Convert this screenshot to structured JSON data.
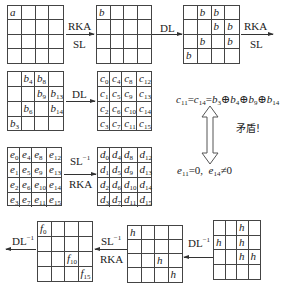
{
  "grids": {
    "a": {
      "cells": [
        "a",
        "",
        "",
        "",
        "",
        "",
        "",
        "",
        "",
        "",
        "",
        "",
        "",
        "",
        "",
        ""
      ]
    },
    "b_plain": {
      "cells": [
        "b",
        "",
        "",
        "",
        "",
        "",
        "",
        "",
        "",
        "",
        "",
        "",
        "",
        "",
        "",
        ""
      ]
    },
    "b_dl": {
      "cells": [
        "",
        "b",
        "b",
        "",
        "",
        "",
        "b",
        "b",
        "",
        "b",
        "",
        "b",
        "b",
        "",
        "",
        ""
      ]
    },
    "b_indexed": {
      "cells": [
        {
          "v": "",
          "s": ""
        },
        {
          "v": "b",
          "s": "4"
        },
        {
          "v": "b",
          "s": "8"
        },
        {
          "v": "",
          "s": ""
        },
        {
          "v": "",
          "s": ""
        },
        {
          "v": "",
          "s": ""
        },
        {
          "v": "b",
          "s": "9"
        },
        {
          "v": "b",
          "s": "13"
        },
        {
          "v": "",
          "s": ""
        },
        {
          "v": "b",
          "s": "6"
        },
        {
          "v": "",
          "s": ""
        },
        {
          "v": "b",
          "s": "14"
        },
        {
          "v": "b",
          "s": "3"
        },
        {
          "v": "",
          "s": ""
        },
        {
          "v": "",
          "s": ""
        },
        {
          "v": "",
          "s": ""
        }
      ]
    },
    "c": {
      "letter": "c",
      "indices": [
        "0",
        "4",
        "8",
        "12",
        "1",
        "5",
        "9",
        "13",
        "2",
        "6",
        "10",
        "14",
        "3",
        "7",
        "11",
        "15"
      ]
    },
    "e": {
      "letter": "e",
      "indices": [
        "0",
        "4",
        "8",
        "12",
        "1",
        "5",
        "9",
        "13",
        "2",
        "6",
        "10",
        "14",
        "3",
        "7",
        "11",
        "15"
      ]
    },
    "d": {
      "letter": "d",
      "indices": [
        "0",
        "4",
        "8",
        "12",
        "1",
        "5",
        "9",
        "13",
        "2",
        "6",
        "10",
        "14",
        "3",
        "7",
        "11",
        "15"
      ]
    },
    "f": {
      "cells": [
        {
          "v": "f",
          "s": "0"
        },
        {
          "v": "",
          "s": ""
        },
        {
          "v": "",
          "s": ""
        },
        {
          "v": "",
          "s": ""
        },
        {
          "v": "",
          "s": ""
        },
        {
          "v": "",
          "s": ""
        },
        {
          "v": "",
          "s": ""
        },
        {
          "v": "",
          "s": ""
        },
        {
          "v": "",
          "s": ""
        },
        {
          "v": "",
          "s": ""
        },
        {
          "v": "f",
          "s": "10"
        },
        {
          "v": "",
          "s": ""
        },
        {
          "v": "",
          "s": ""
        },
        {
          "v": "",
          "s": ""
        },
        {
          "v": "",
          "s": ""
        },
        {
          "v": "f",
          "s": "15"
        }
      ]
    },
    "h_sl": {
      "cells": [
        "h",
        "",
        "",
        "",
        "",
        "",
        "",
        "",
        "",
        "",
        "h",
        "",
        "",
        "",
        "",
        "h"
      ]
    },
    "h_dl": {
      "cells": [
        "",
        "",
        "h",
        "",
        "h",
        "",
        "h",
        "",
        "",
        "",
        "h",
        "h",
        "",
        "",
        "",
        ""
      ]
    }
  },
  "labels": {
    "rka": "RKA",
    "sl": "SL",
    "dl": "DL",
    "sl_inv": "SL",
    "dl_inv": "DL",
    "inv_sup": "−1",
    "contradiction": "矛盾!"
  },
  "equations": {
    "top": {
      "lhs1": "c",
      "lhs1_sub": "11",
      "lhs2": "c",
      "lhs2_sub": "14",
      "terms": [
        {
          "v": "b",
          "s": "3"
        },
        {
          "v": "b",
          "s": "4"
        },
        {
          "v": "b",
          "s": "9"
        },
        {
          "v": "b",
          "s": "14"
        }
      ]
    },
    "bottom": {
      "e1": "e",
      "e1_sub": "11",
      "v1": "0",
      "e2": "e",
      "e2_sub": "14",
      "v2": "0"
    }
  }
}
